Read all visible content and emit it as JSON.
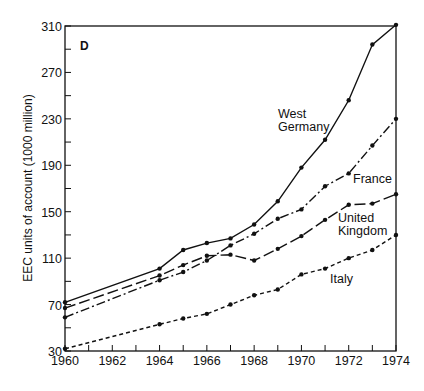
{
  "chart_data": {
    "type": "line",
    "title": "",
    "panel_label": "D",
    "xlabel": "",
    "ylabel": "EEC units of account (1000 million)",
    "xlim": [
      1960,
      1974
    ],
    "ylim": [
      30,
      310
    ],
    "x_ticks": [
      1960,
      1962,
      1964,
      1966,
      1968,
      1970,
      1972,
      1974
    ],
    "y_ticks": [
      30,
      70,
      110,
      150,
      190,
      230,
      270,
      310
    ],
    "grid": false,
    "legend": "inline labels",
    "x": [
      1960,
      1964,
      1965,
      1966,
      1967,
      1968,
      1969,
      1970,
      1971,
      1972,
      1973,
      1974
    ],
    "series": [
      {
        "name": "West Germany",
        "label_lines": [
          "West",
          "Germany"
        ],
        "style": "solid",
        "values": [
          72,
          101,
          117,
          123,
          127,
          139,
          159,
          188,
          212,
          246,
          294,
          312
        ]
      },
      {
        "name": "France",
        "label_lines": [
          "France"
        ],
        "style": "dash-dot",
        "values": [
          59,
          91,
          98,
          108,
          121,
          131,
          144,
          152,
          172,
          183,
          207,
          230
        ]
      },
      {
        "name": "United Kingdom",
        "label_lines": [
          "United",
          "Kingdom"
        ],
        "style": "long-dash",
        "values": [
          67,
          95,
          104,
          112,
          113,
          108,
          118,
          129,
          143,
          156,
          157,
          165
        ]
      },
      {
        "name": "Italy",
        "label_lines": [
          "Italy"
        ],
        "style": "short-dash",
        "values": [
          32,
          53,
          58,
          62,
          70,
          78,
          83,
          96,
          101,
          110,
          117,
          130
        ]
      }
    ]
  }
}
